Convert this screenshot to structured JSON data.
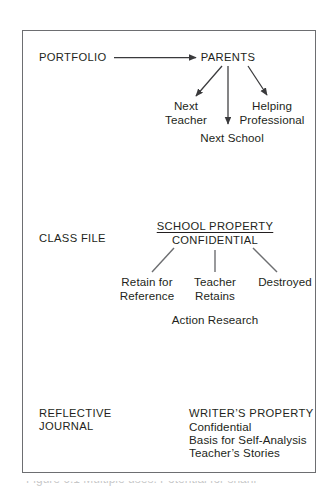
{
  "figure": {
    "row_labels": [
      {
        "id": "portfolio",
        "text": "PORTFOLIO"
      },
      {
        "id": "class-file",
        "text": "CLASS FILE"
      },
      {
        "id": "reflective-journal-line1",
        "text": "REFLECTIVE"
      },
      {
        "id": "reflective-journal-line2",
        "text": "JOURNAL"
      }
    ],
    "portfolio_branch": {
      "root": "PARENTS",
      "children": [
        {
          "line1": "Next",
          "line2": "Teacher"
        },
        {
          "line1": "Next School",
          "line2": ""
        },
        {
          "line1": "Helping",
          "line2": "Professional"
        }
      ]
    },
    "class_file_branch": {
      "heading_underlined": "SCHOOL PROPERTY",
      "heading_second": "CONFIDENTIAL",
      "children": [
        {
          "line1": "Retain for",
          "line2": "Reference"
        },
        {
          "line1": "Teacher",
          "line2": "Retains"
        },
        {
          "line1": "Destroyed",
          "line2": ""
        }
      ],
      "footnote": "Action Research"
    },
    "reflective_journal_block": {
      "heading": "WRITER’S PROPERTY",
      "lines": [
        "Confidential",
        "Basis for Self-Analysis",
        "Teacher’s Stories"
      ]
    },
    "cropped_caption_sliver": "Figure 6.1 Multiple uses. Potential for sharing.",
    "colors": {
      "ink": "#231f20",
      "frame": "#6d6e71",
      "connector": "#3a3a3c",
      "page": "#ffffff"
    }
  }
}
